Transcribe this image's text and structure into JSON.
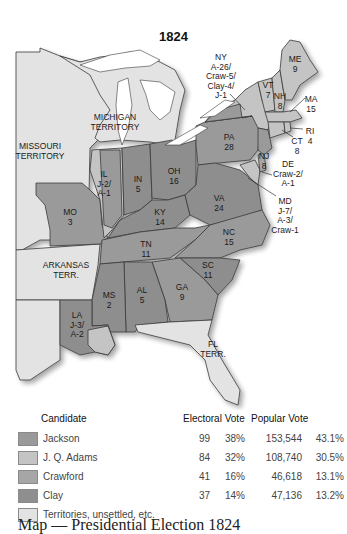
{
  "map": {
    "title": "1824",
    "colors": {
      "jackson": "#9a9a9a",
      "adams": "#c4c4c4",
      "crawford": "#a6a6a6",
      "clay": "#8e8e8e",
      "territory": "#e3e3e3",
      "water": "#ffffff",
      "border": "#3a3a3a"
    },
    "labels": {
      "missouri_territory": "MISSOURI\nTERRITORY",
      "michigan_territory": "MICHIGAN\nTERRITORY",
      "arkansas_terr": "ARKANSAS\nTERR.",
      "fl_terr": "FL\nTERR.",
      "ny": "NY\nA-26/\nCraw-5/\nClay-4/\nJ-1",
      "me": "ME\n9",
      "vt": "VT\n7",
      "nh": "NH\n8",
      "ma": "MA\n15",
      "ri": "RI\n4",
      "ct": "CT\n8",
      "nj": "NJ\n8",
      "de": "DE\nCraw-2/\nA-1",
      "md": "MD\nJ-7/\nA-3/\nCraw-1",
      "pa": "PA\n28",
      "oh": "OH\n16",
      "in": "IN\n5",
      "il": "IL\nJ-2/\nA-1",
      "mo": "MO\n3",
      "ky": "KY\n14",
      "va": "VA\n24",
      "nc": "NC\n15",
      "tn": "TN\n11",
      "sc": "SC\n11",
      "ga": "GA\n9",
      "al": "AL\n5",
      "ms": "MS\n2",
      "la": "LA\nJ-3/\nA-2"
    }
  },
  "legend": {
    "headers": {
      "candidate": "Candidate",
      "electoral": "Electoral Vote",
      "popular": "Popular Vote"
    },
    "rows": [
      {
        "name": "Jackson",
        "electoral": "99",
        "electoral_pct": "38%",
        "popular": "153,544",
        "popular_pct": "43.1%",
        "color": "#9a9a9a"
      },
      {
        "name": "J. Q. Adams",
        "electoral": "84",
        "electoral_pct": "32%",
        "popular": "108,740",
        "popular_pct": "30.5%",
        "color": "#c4c4c4"
      },
      {
        "name": "Crawford",
        "electoral": "41",
        "electoral_pct": "16%",
        "popular": "46,618",
        "popular_pct": "13.1%",
        "color": "#a6a6a6"
      },
      {
        "name": "Clay",
        "electoral": "37",
        "electoral_pct": "14%",
        "popular": "47,136",
        "popular_pct": "13.2%",
        "color": "#8e8e8e"
      }
    ],
    "territories_label": "Territories, unsettled, etc.",
    "territories_color": "#e3e3e3"
  },
  "caption": "Map — Presidential Election 1824"
}
